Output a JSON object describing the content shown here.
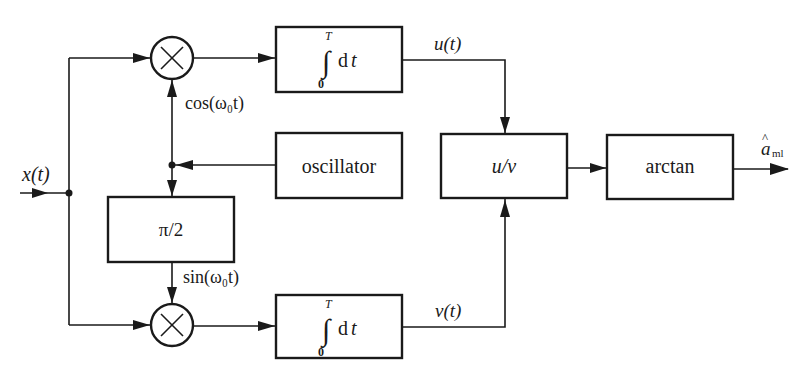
{
  "diagram": {
    "type": "block-diagram",
    "input": {
      "label": "x(t)"
    },
    "output": {
      "label": "â_ml",
      "symbol": "a",
      "accent": "^",
      "subscript": "ml"
    },
    "blocks": {
      "top_integrator": {
        "upper_limit": "T",
        "lower_limit": "0",
        "body": "dt"
      },
      "bottom_integrator": {
        "upper_limit": "T",
        "lower_limit": "0",
        "body": "dt"
      },
      "oscillator": {
        "label": "oscillator"
      },
      "phase_shift": {
        "label": "π/2"
      },
      "divider": {
        "label": "u/v"
      },
      "arctan": {
        "label": "arctan"
      }
    },
    "multipliers": {
      "top": {
        "symbol": "×"
      },
      "bottom": {
        "symbol": "×"
      }
    },
    "signals": {
      "cos": "cos(ω₀t)",
      "sin": "sin(ω₀t)",
      "u": "u(t)",
      "v": "v(t)"
    },
    "connections": [
      {
        "from": "input",
        "to": "top_multiplier"
      },
      {
        "from": "input",
        "to": "bottom_multiplier"
      },
      {
        "from": "oscillator",
        "to": "top_multiplier",
        "signal": "cos(ω₀t)"
      },
      {
        "from": "oscillator",
        "to": "phase_shift"
      },
      {
        "from": "phase_shift",
        "to": "bottom_multiplier",
        "signal": "sin(ω₀t)"
      },
      {
        "from": "top_multiplier",
        "to": "top_integrator"
      },
      {
        "from": "bottom_multiplier",
        "to": "bottom_integrator"
      },
      {
        "from": "top_integrator",
        "to": "divider",
        "signal": "u(t)"
      },
      {
        "from": "bottom_integrator",
        "to": "divider",
        "signal": "v(t)"
      },
      {
        "from": "divider",
        "to": "arctan"
      },
      {
        "from": "arctan",
        "to": "output"
      }
    ]
  }
}
